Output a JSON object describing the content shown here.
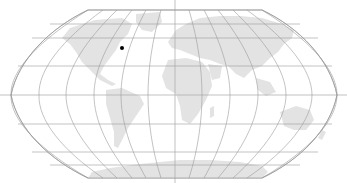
{
  "map": {
    "projection": "Robinson",
    "background": "#ffffff",
    "land_color": "#e3e3e3",
    "graticule_color": "#9a9a9a",
    "marker_color": "#000000",
    "graticule": {
      "meridian_step_deg": 30,
      "parallel_step_deg": 20
    },
    "markers": [
      {
        "name": "location-marker",
        "approx_region": "North Atlantic near Newfoundland",
        "x": 122,
        "y": 48
      }
    ]
  }
}
